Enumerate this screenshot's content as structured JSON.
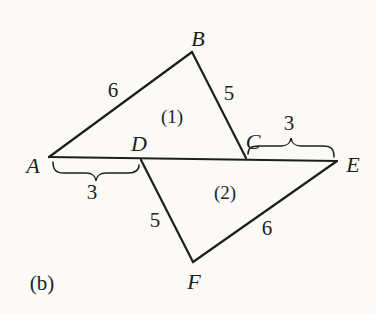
{
  "figure": {
    "caption": "(b)",
    "colors": {
      "ink": "#1e1e1e",
      "background": "#fbfaf7"
    },
    "vertices": {
      "A": "A",
      "B": "B",
      "C": "C",
      "D": "D",
      "E": "E",
      "F": "F"
    },
    "regions": {
      "triangle1": "(1)",
      "triangle2": "(2)"
    },
    "side_lengths": {
      "AB": "6",
      "BC": "5",
      "AD": "3",
      "CE": "3",
      "DF": "5",
      "FE": "6"
    }
  }
}
